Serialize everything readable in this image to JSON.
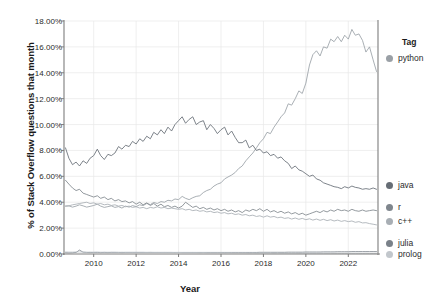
{
  "chart_data": {
    "type": "line",
    "title": "",
    "xlabel": "Year",
    "ylabel": "% of Stack Overflow questions that month",
    "legend_title": "Tag",
    "legend_position": "right",
    "grid": true,
    "xlim": [
      2008.6,
      2023.4
    ],
    "ylim": [
      0.0,
      18.0
    ],
    "xticks": [
      2010,
      2012,
      2014,
      2016,
      2018,
      2020,
      2022
    ],
    "xtick_labels": [
      "2010",
      "2012",
      "2014",
      "2016",
      "2018",
      "2020",
      "2022"
    ],
    "yticks": [
      0,
      2,
      4,
      6,
      8,
      10,
      12,
      14,
      16,
      18
    ],
    "ytick_labels": [
      "0.00%",
      "2.00%",
      "4.00%",
      "6.00%",
      "8.00%",
      "10.00%",
      "12.00%",
      "14.00%",
      "16.00%",
      "18.00%"
    ],
    "x": [
      2008.67,
      2008.83,
      2009.0,
      2009.17,
      2009.33,
      2009.5,
      2009.67,
      2009.83,
      2010.0,
      2010.17,
      2010.33,
      2010.5,
      2010.67,
      2010.83,
      2011.0,
      2011.17,
      2011.33,
      2011.5,
      2011.67,
      2011.83,
      2012.0,
      2012.17,
      2012.33,
      2012.5,
      2012.67,
      2012.83,
      2013.0,
      2013.17,
      2013.33,
      2013.5,
      2013.67,
      2013.83,
      2014.0,
      2014.17,
      2014.33,
      2014.5,
      2014.67,
      2014.83,
      2015.0,
      2015.17,
      2015.33,
      2015.5,
      2015.67,
      2015.83,
      2016.0,
      2016.17,
      2016.33,
      2016.5,
      2016.67,
      2016.83,
      2017.0,
      2017.17,
      2017.33,
      2017.5,
      2017.67,
      2017.83,
      2018.0,
      2018.17,
      2018.33,
      2018.5,
      2018.67,
      2018.83,
      2019.0,
      2019.17,
      2019.33,
      2019.5,
      2019.67,
      2019.83,
      2020.0,
      2020.17,
      2020.33,
      2020.5,
      2020.67,
      2020.83,
      2021.0,
      2021.17,
      2021.33,
      2021.5,
      2021.67,
      2021.83,
      2022.0,
      2022.17,
      2022.33,
      2022.5,
      2022.67,
      2022.83,
      2023.0,
      2023.17,
      2023.33
    ],
    "series": [
      {
        "name": "python",
        "color": "#9aa0a6",
        "values": [
          3.7,
          3.72,
          3.62,
          3.7,
          3.8,
          3.72,
          3.62,
          3.68,
          3.75,
          3.85,
          3.7,
          3.6,
          3.66,
          3.72,
          3.6,
          3.66,
          3.55,
          3.7,
          3.62,
          3.74,
          3.66,
          3.8,
          3.74,
          3.9,
          3.82,
          3.98,
          3.9,
          4.05,
          4.0,
          4.15,
          4.1,
          4.25,
          4.2,
          4.45,
          4.3,
          4.2,
          4.35,
          4.45,
          4.5,
          4.75,
          4.9,
          5.0,
          5.25,
          5.4,
          5.5,
          5.8,
          5.95,
          6.1,
          6.3,
          6.6,
          6.8,
          7.2,
          7.5,
          7.8,
          8.2,
          8.6,
          8.9,
          9.4,
          9.3,
          9.8,
          10.2,
          10.6,
          10.9,
          11.6,
          11.5,
          12.0,
          12.6,
          12.4,
          13.2,
          14.6,
          15.4,
          15.7,
          15.3,
          16.0,
          15.9,
          16.6,
          16.4,
          16.8,
          16.4,
          16.9,
          16.6,
          17.35,
          16.9,
          17.0,
          16.5,
          15.6,
          16.0,
          15.0,
          14.1
        ]
      },
      {
        "name": "java",
        "color": "#666d75",
        "values": [
          8.2,
          7.4,
          6.9,
          7.1,
          6.8,
          7.2,
          7.0,
          7.4,
          7.6,
          8.1,
          7.6,
          7.3,
          7.7,
          7.6,
          7.8,
          8.3,
          8.1,
          8.4,
          8.3,
          8.7,
          8.5,
          8.9,
          8.7,
          9.1,
          8.9,
          9.4,
          9.2,
          9.6,
          9.3,
          9.8,
          9.5,
          10.0,
          10.3,
          10.6,
          10.1,
          10.4,
          10.6,
          10.0,
          10.2,
          10.3,
          9.6,
          10.0,
          9.7,
          9.3,
          9.6,
          9.8,
          9.2,
          9.5,
          9.0,
          8.6,
          8.6,
          8.8,
          8.2,
          8.4,
          8.0,
          8.1,
          7.8,
          7.9,
          7.6,
          7.7,
          7.4,
          7.5,
          7.2,
          7.0,
          6.6,
          6.8,
          6.5,
          6.4,
          6.2,
          6.0,
          6.1,
          5.8,
          5.7,
          5.5,
          5.4,
          5.3,
          5.2,
          5.15,
          5.05,
          5.2,
          5.1,
          5.25,
          5.15,
          5.1,
          5.0,
          5.05,
          5.0,
          5.1,
          5.0
        ]
      },
      {
        "name": "r",
        "color": "#7f868d",
        "values": [
          5.7,
          5.4,
          5.1,
          4.9,
          5.0,
          4.7,
          4.6,
          4.5,
          4.4,
          4.5,
          4.3,
          4.4,
          4.2,
          4.3,
          4.1,
          4.2,
          4.05,
          4.1,
          3.95,
          4.05,
          3.85,
          4.0,
          3.8,
          3.95,
          3.75,
          3.9,
          3.7,
          3.85,
          3.65,
          3.75,
          3.6,
          3.7,
          3.55,
          3.7,
          4.0,
          3.8,
          3.6,
          3.7,
          3.5,
          3.6,
          3.45,
          3.55,
          3.4,
          3.5,
          3.35,
          3.45,
          3.3,
          3.4,
          3.25,
          3.35,
          3.2,
          3.4,
          3.3,
          3.45,
          3.35,
          3.5,
          3.3,
          3.45,
          3.25,
          3.35,
          3.2,
          3.3,
          3.15,
          3.25,
          3.1,
          3.2,
          3.05,
          3.15,
          3.0,
          3.1,
          3.2,
          3.3,
          3.2,
          3.35,
          3.25,
          3.4,
          3.3,
          3.45,
          3.35,
          3.4,
          3.3,
          3.45,
          3.35,
          3.3,
          3.4,
          3.3,
          3.35,
          3.4,
          3.35
        ]
      },
      {
        "name": "c++",
        "color": "#a8aeb4",
        "values": [
          3.7,
          3.72,
          3.8,
          3.85,
          3.9,
          3.95,
          4.0,
          3.9,
          3.95,
          3.85,
          3.9,
          3.8,
          3.85,
          3.75,
          3.8,
          3.7,
          3.75,
          3.65,
          3.7,
          3.6,
          3.65,
          3.55,
          3.6,
          3.5,
          3.6,
          3.55,
          3.65,
          3.55,
          3.6,
          3.5,
          3.55,
          3.5,
          3.45,
          3.5,
          3.4,
          3.45,
          3.35,
          3.4,
          3.3,
          3.35,
          3.25,
          3.3,
          3.2,
          3.25,
          3.15,
          3.2,
          3.1,
          3.15,
          3.05,
          3.1,
          3.0,
          3.05,
          2.95,
          3.0,
          2.9,
          2.95,
          2.85,
          2.95,
          2.85,
          2.9,
          2.8,
          2.85,
          2.75,
          2.8,
          2.7,
          2.78,
          2.68,
          2.75,
          2.65,
          2.72,
          2.62,
          2.7,
          2.6,
          2.68,
          2.58,
          2.65,
          2.55,
          2.62,
          2.52,
          2.58,
          2.5,
          2.55,
          2.45,
          2.5,
          2.4,
          2.42,
          2.35,
          2.3,
          2.25
        ]
      },
      {
        "name": "julia",
        "color": "#7a8189",
        "values": [
          0.1,
          0.09,
          0.1,
          0.12,
          0.3,
          0.14,
          0.12,
          0.11,
          0.12,
          0.12,
          0.11,
          0.12,
          0.11,
          0.12,
          0.12,
          0.12,
          0.11,
          0.12,
          0.12,
          0.12,
          0.12,
          0.12,
          0.12,
          0.12,
          0.12,
          0.12,
          0.12,
          0.12,
          0.12,
          0.12,
          0.12,
          0.12,
          0.12,
          0.12,
          0.12,
          0.12,
          0.12,
          0.12,
          0.12,
          0.12,
          0.12,
          0.12,
          0.12,
          0.12,
          0.12,
          0.12,
          0.12,
          0.12,
          0.12,
          0.12,
          0.12,
          0.12,
          0.12,
          0.12,
          0.12,
          0.13,
          0.13,
          0.13,
          0.13,
          0.13,
          0.13,
          0.13,
          0.13,
          0.14,
          0.14,
          0.14,
          0.14,
          0.14,
          0.15,
          0.15,
          0.15,
          0.15,
          0.15,
          0.16,
          0.16,
          0.16,
          0.16,
          0.17,
          0.17,
          0.17,
          0.17,
          0.18,
          0.18,
          0.18,
          0.18,
          0.18,
          0.18,
          0.18,
          0.18
        ]
      },
      {
        "name": "prolog",
        "color": "#c2c7cc",
        "values": [
          0.16,
          0.15,
          0.15,
          0.16,
          0.15,
          0.15,
          0.14,
          0.15,
          0.14,
          0.15,
          0.14,
          0.14,
          0.14,
          0.14,
          0.14,
          0.13,
          0.14,
          0.13,
          0.13,
          0.13,
          0.13,
          0.13,
          0.13,
          0.12,
          0.13,
          0.12,
          0.12,
          0.12,
          0.12,
          0.12,
          0.12,
          0.11,
          0.12,
          0.11,
          0.11,
          0.11,
          0.11,
          0.11,
          0.1,
          0.11,
          0.1,
          0.1,
          0.1,
          0.1,
          0.1,
          0.09,
          0.1,
          0.09,
          0.09,
          0.09,
          0.09,
          0.09,
          0.08,
          0.09,
          0.08,
          0.08,
          0.08,
          0.08,
          0.08,
          0.07,
          0.08,
          0.07,
          0.07,
          0.07,
          0.07,
          0.07,
          0.06,
          0.07,
          0.06,
          0.06,
          0.06,
          0.06,
          0.06,
          0.06,
          0.05,
          0.06,
          0.05,
          0.05,
          0.05,
          0.05,
          0.05,
          0.05,
          0.05,
          0.05,
          0.04,
          0.05,
          0.04,
          0.04,
          0.04
        ]
      }
    ],
    "legend_entries": [
      {
        "label": "python",
        "color": "#9aa0a6",
        "y": 58
      },
      {
        "label": "java",
        "color": "#666d75",
        "y": 185
      },
      {
        "label": "r",
        "color": "#7f868d",
        "y": 207
      },
      {
        "label": "c++",
        "color": "#a8aeb4",
        "y": 221
      },
      {
        "label": "julia",
        "color": "#7a8189",
        "y": 243
      },
      {
        "label": "prolog",
        "color": "#c2c7cc",
        "y": 254
      }
    ],
    "style": {
      "grid_color": "#e8e8e8",
      "axis_color": "#7d7d7d",
      "background": "#ffffff",
      "text_color": "#2b2b2b"
    }
  }
}
